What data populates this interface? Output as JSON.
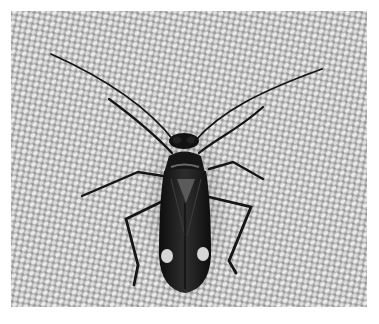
{
  "image": {
    "subject": "Insect (plant bug) on woven fabric",
    "alt": "Dark plant bug with long antennae and two pale spots on its wing tips, resting on a textured woven fabric",
    "colors": {
      "background": "#ffffff",
      "fabric_light": "#e6e6e6",
      "fabric_dark": "#8f8f8f",
      "insect_body": "#141414",
      "insect_highlight": "#5a5a5a",
      "spot": "#d8d8d8"
    }
  }
}
